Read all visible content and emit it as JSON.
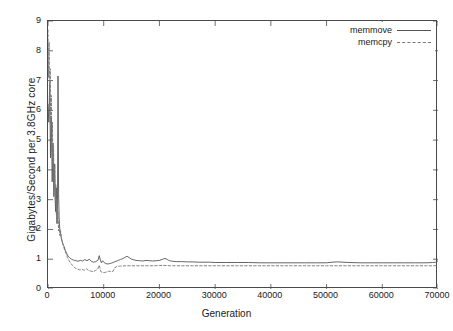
{
  "chart_data": {
    "type": "line",
    "title": "",
    "xlabel": "Generation",
    "ylabel": "Gigabytes/Second  per 3.8GHz  core",
    "xlim": [
      0,
      70000
    ],
    "ylim": [
      0,
      9
    ],
    "xticks": [
      0,
      10000,
      20000,
      30000,
      40000,
      50000,
      60000,
      70000
    ],
    "xtick_labels": [
      "0",
      "10000",
      "20000",
      "30000",
      "40000",
      "50000",
      "60000",
      "70000"
    ],
    "yticks": [
      0,
      1,
      2,
      3,
      4,
      5,
      6,
      7,
      8,
      9
    ],
    "ytick_labels": [
      "0",
      "1",
      "2",
      "3",
      "4",
      "5",
      "6",
      "7",
      "8",
      "9"
    ],
    "grid": false,
    "legend_position": "top-right",
    "series": [
      {
        "name": "memmove",
        "style": "solid",
        "color": "#555555",
        "x": [
          0,
          150,
          300,
          450,
          600,
          750,
          900,
          1050,
          1200,
          1350,
          1500,
          1600,
          1700,
          1750,
          1800,
          1850,
          1900,
          2000,
          2100,
          2200,
          2350,
          2500,
          2700,
          2900,
          3100,
          3300,
          3600,
          3900,
          4200,
          4600,
          5000,
          5400,
          5800,
          6200,
          6600,
          7000,
          7400,
          7800,
          8200,
          8600,
          9000,
          9200,
          9400,
          9600,
          9800,
          10000,
          10300,
          10600,
          11000,
          11400,
          11800,
          12200,
          12600,
          13000,
          13400,
          13800,
          14200,
          14600,
          15000,
          15400,
          15800,
          16400,
          17000,
          17600,
          18200,
          18800,
          19400,
          20000,
          20600,
          21000,
          21400,
          21800,
          22400,
          23000,
          24000,
          25000,
          26000,
          27000,
          28000,
          29000,
          30000,
          32000,
          34000,
          36000,
          38000,
          40000,
          42000,
          44000,
          46000,
          48000,
          50000,
          51000,
          52000,
          54000,
          56000,
          58000,
          60000,
          62000,
          64000,
          66000,
          68000,
          69000,
          69600,
          70000
        ],
        "y": [
          6.2,
          5.6,
          6.9,
          4.4,
          5.8,
          3.6,
          4.9,
          3.1,
          4.2,
          2.6,
          3.4,
          2.2,
          2.8,
          5.1,
          7.15,
          5.4,
          3.2,
          2.4,
          2.05,
          1.95,
          1.75,
          1.62,
          1.5,
          1.42,
          1.3,
          1.22,
          1.1,
          1.05,
          1.0,
          0.97,
          0.95,
          0.93,
          0.96,
          0.94,
          0.99,
          0.95,
          1.0,
          0.93,
          0.9,
          0.92,
          0.98,
          1.12,
          0.97,
          0.88,
          0.95,
          0.9,
          0.86,
          0.84,
          0.85,
          0.87,
          0.9,
          0.93,
          0.96,
          0.99,
          1.02,
          1.06,
          1.1,
          1.05,
          1.0,
          0.98,
          0.96,
          0.95,
          0.94,
          0.96,
          0.95,
          0.94,
          0.95,
          0.96,
          1.0,
          1.03,
          0.99,
          0.95,
          0.93,
          0.92,
          0.92,
          0.91,
          0.91,
          0.9,
          0.9,
          0.9,
          0.89,
          0.89,
          0.89,
          0.89,
          0.88,
          0.88,
          0.88,
          0.88,
          0.88,
          0.88,
          0.88,
          0.9,
          0.91,
          0.89,
          0.88,
          0.88,
          0.88,
          0.88,
          0.88,
          0.88,
          0.88,
          0.89,
          0.9,
          0.95
        ]
      },
      {
        "name": "memcpy",
        "style": "dashed",
        "color": "#777777",
        "x": [
          0,
          100,
          200,
          300,
          400,
          500,
          600,
          700,
          800,
          900,
          1000,
          1100,
          1200,
          1300,
          1400,
          1500,
          1600,
          1700,
          1800,
          1900,
          2000,
          2100,
          2250,
          2400,
          2600,
          2800,
          3000,
          3200,
          3500,
          3800,
          4100,
          4500,
          4900,
          5300,
          5700,
          6100,
          6500,
          6900,
          7300,
          7700,
          8100,
          8500,
          8900,
          9200,
          9500,
          9800,
          10100,
          10500,
          10900,
          11300,
          11700,
          12000,
          12400,
          13000,
          14000,
          15000,
          16000,
          17000,
          18000,
          19000,
          20000,
          21000,
          22000,
          23000,
          24000,
          26000,
          28000,
          30000,
          32000,
          34000,
          36000,
          38000,
          40000,
          42000,
          44000,
          46000,
          48000,
          50000,
          52000,
          54000,
          56000,
          58000,
          60000,
          62000,
          64000,
          66000,
          68000,
          69000,
          70000
        ],
        "y": [
          8.7,
          7.1,
          8.3,
          6.2,
          7.4,
          5.3,
          6.5,
          4.6,
          5.6,
          4.0,
          4.8,
          3.4,
          4.1,
          2.9,
          3.5,
          2.5,
          3.0,
          2.2,
          2.6,
          1.95,
          2.25,
          1.8,
          1.95,
          1.7,
          1.55,
          1.42,
          1.3,
          1.2,
          1.05,
          0.95,
          0.85,
          0.78,
          0.7,
          0.67,
          0.64,
          0.66,
          0.63,
          0.68,
          0.62,
          0.6,
          0.58,
          0.62,
          0.66,
          0.8,
          0.58,
          0.56,
          0.55,
          0.57,
          0.6,
          0.58,
          0.6,
          0.72,
          0.76,
          0.77,
          0.78,
          0.78,
          0.78,
          0.78,
          0.78,
          0.78,
          0.79,
          0.79,
          0.78,
          0.78,
          0.78,
          0.78,
          0.78,
          0.78,
          0.78,
          0.78,
          0.78,
          0.78,
          0.78,
          0.78,
          0.78,
          0.78,
          0.78,
          0.78,
          0.78,
          0.78,
          0.78,
          0.78,
          0.78,
          0.78,
          0.78,
          0.78,
          0.78,
          0.78,
          0.79
        ]
      }
    ]
  },
  "legend": {
    "entries": [
      {
        "label": "memmove"
      },
      {
        "label": "memcpy"
      }
    ]
  },
  "axes": {
    "x_title": "Generation",
    "y_title": "Gigabytes/Second  per 3.8GHz  core"
  }
}
